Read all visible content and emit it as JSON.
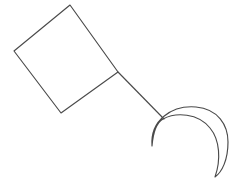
{
  "canvas": {
    "width": 244,
    "height": 186,
    "background_color": "#ffffff",
    "stroke_color": "#4a4a4a",
    "stroke_width": 1.15,
    "description": "Black-and-white line drawing: a tilted square connected by a straight line to a crescent moon shape"
  },
  "shapes": {
    "square": {
      "name": "tilted-square",
      "label": "Square",
      "vertices": [
        {
          "x": 70,
          "y": 5
        },
        {
          "x": 118,
          "y": 72
        },
        {
          "x": 61,
          "y": 113
        },
        {
          "x": 14,
          "y": 51
        }
      ],
      "path": "M 70 5 L 118 72 L 61 113 L 14 51 Z"
    },
    "connector": {
      "name": "connector-line",
      "label": "Line",
      "from": {
        "x": 118,
        "y": 72
      },
      "to": {
        "x": 164,
        "y": 119
      },
      "path": "M 118 72 L 164 119"
    },
    "crescent": {
      "name": "crescent-moon",
      "label": "Crescent",
      "horn_upper_left": {
        "x": 152,
        "y": 146
      },
      "horn_lower_right": {
        "x": 215,
        "y": 177
      },
      "outer_extent_right": {
        "x": 228,
        "y": 140
      },
      "outer_apex": {
        "x": 195,
        "y": 107
      },
      "path": "M 152 146 C 150 120 172 105 196 107 C 218 109 228 125 228 142 C 228 160 222 172 215 177 C 221 160 220 140 210 128 C 198 113 176 112 163 119 C 156 123 153 134 152 146 Z"
    }
  }
}
